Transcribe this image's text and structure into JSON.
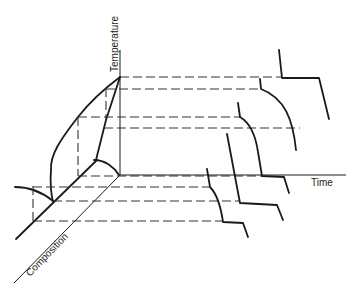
{
  "diagram": {
    "axes": {
      "temperature": "Temperature",
      "time": "Time",
      "composition": "Composition"
    }
  }
}
